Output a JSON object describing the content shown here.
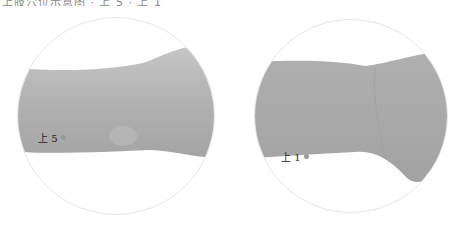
{
  "header_fragment": {
    "text": "上肢穴位示意图 · 上 5 · 上 1"
  },
  "figures": [
    {
      "id": "left",
      "subject": "forearm (dorsal view)",
      "point_label": "上 5",
      "point_color": "#9a9a9a",
      "skin_color": "#b4b4b4"
    },
    {
      "id": "right",
      "subject": "wrist (palmar view)",
      "point_label": "上 1",
      "point_color": "#9a9a9a",
      "skin_color": "#aaaaaa"
    }
  ]
}
